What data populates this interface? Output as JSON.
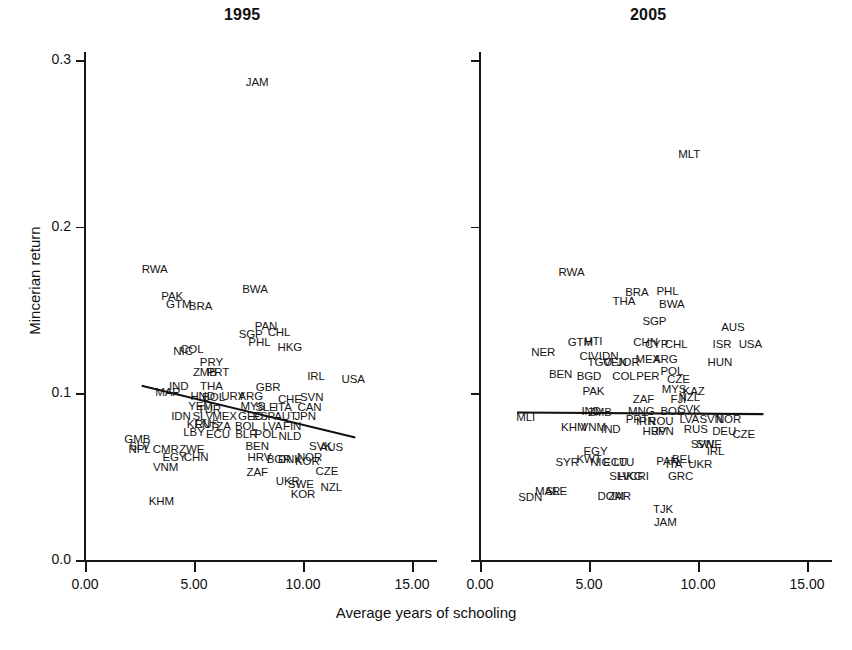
{
  "figure": {
    "xlabel": "Average years of schooling",
    "ylabel": "Mincerian return",
    "ink_color": "#111111"
  },
  "chart_data": {
    "type": "scatter",
    "title": "",
    "xlabel": "Average years of schooling",
    "ylabel": "Mincerian return",
    "xlim": [
      0.0,
      15.0
    ],
    "ylim": [
      0.0,
      0.3
    ],
    "xticks": [
      "0.00",
      "5.00",
      "10.00",
      "15.00"
    ],
    "yticks": [
      "0.0",
      "0.1",
      "0.2",
      "0.3"
    ],
    "grid": false,
    "legend": "none",
    "marker_style": "country-code-text-label",
    "panels": [
      {
        "name": "panel-1995",
        "title": "1995",
        "fit_line": {
          "x0": 2.6,
          "y0": 0.1045,
          "x1": 12.4,
          "y1": 0.0735
        },
        "points": [
          {
            "label": "JAM",
            "x": 7.9,
            "y": 0.286
          },
          {
            "label": "RWA",
            "x": 3.2,
            "y": 0.174
          },
          {
            "label": "PAK",
            "x": 4.0,
            "y": 0.158
          },
          {
            "label": "GTM",
            "x": 4.3,
            "y": 0.153
          },
          {
            "label": "BRA",
            "x": 5.3,
            "y": 0.152
          },
          {
            "label": "BWA",
            "x": 7.8,
            "y": 0.162
          },
          {
            "label": "PAN",
            "x": 8.3,
            "y": 0.14
          },
          {
            "label": "SGP",
            "x": 7.6,
            "y": 0.135
          },
          {
            "label": "CHL",
            "x": 8.9,
            "y": 0.136
          },
          {
            "label": "PHL",
            "x": 8.0,
            "y": 0.13
          },
          {
            "label": "HKG",
            "x": 9.4,
            "y": 0.127
          },
          {
            "label": "NIC",
            "x": 4.5,
            "y": 0.125
          },
          {
            "label": "COL",
            "x": 4.9,
            "y": 0.126
          },
          {
            "label": "PRY",
            "x": 5.8,
            "y": 0.118
          },
          {
            "label": "ZMB",
            "x": 5.5,
            "y": 0.112
          },
          {
            "label": "PRT",
            "x": 6.1,
            "y": 0.112
          },
          {
            "label": "IRL",
            "x": 10.6,
            "y": 0.11
          },
          {
            "label": "USA",
            "x": 12.3,
            "y": 0.108
          },
          {
            "label": "IND",
            "x": 4.3,
            "y": 0.104
          },
          {
            "label": "THA",
            "x": 5.8,
            "y": 0.104
          },
          {
            "label": "GBR",
            "x": 8.4,
            "y": 0.103
          },
          {
            "label": "MAR",
            "x": 3.8,
            "y": 0.1
          },
          {
            "label": "HND",
            "x": 5.4,
            "y": 0.098
          },
          {
            "label": "BOL",
            "x": 5.9,
            "y": 0.097
          },
          {
            "label": "URY",
            "x": 6.8,
            "y": 0.098
          },
          {
            "label": "ARG",
            "x": 7.6,
            "y": 0.098
          },
          {
            "label": "CHE",
            "x": 9.4,
            "y": 0.096
          },
          {
            "label": "SVN",
            "x": 10.4,
            "y": 0.097
          },
          {
            "label": "YEM",
            "x": 5.3,
            "y": 0.092
          },
          {
            "label": "TUR",
            "x": 5.7,
            "y": 0.09
          },
          {
            "label": "MYS",
            "x": 7.7,
            "y": 0.092
          },
          {
            "label": "SLE",
            "x": 8.3,
            "y": 0.091
          },
          {
            "label": "ITA",
            "x": 9.1,
            "y": 0.091
          },
          {
            "label": "CAN",
            "x": 10.3,
            "y": 0.091
          },
          {
            "label": "IDN",
            "x": 4.4,
            "y": 0.086
          },
          {
            "label": "SLV",
            "x": 5.4,
            "y": 0.086
          },
          {
            "label": "MEX",
            "x": 6.4,
            "y": 0.086
          },
          {
            "label": "GEO",
            "x": 7.6,
            "y": 0.086
          },
          {
            "label": "ESP",
            "x": 8.2,
            "y": 0.086
          },
          {
            "label": "AUT",
            "x": 9.2,
            "y": 0.086
          },
          {
            "label": "JPN",
            "x": 10.1,
            "y": 0.086
          },
          {
            "label": "KEN",
            "x": 5.2,
            "y": 0.081
          },
          {
            "label": "RUS",
            "x": 5.6,
            "y": 0.081
          },
          {
            "label": "TZA",
            "x": 6.2,
            "y": 0.08
          },
          {
            "label": "BOL",
            "x": 7.4,
            "y": 0.08
          },
          {
            "label": "LVA",
            "x": 8.6,
            "y": 0.08
          },
          {
            "label": "FIN",
            "x": 9.5,
            "y": 0.08
          },
          {
            "label": "LBY",
            "x": 5.0,
            "y": 0.076
          },
          {
            "label": "ECU",
            "x": 6.1,
            "y": 0.075
          },
          {
            "label": "BLR",
            "x": 7.4,
            "y": 0.075
          },
          {
            "label": "POL",
            "x": 8.3,
            "y": 0.075
          },
          {
            "label": "NLD",
            "x": 9.4,
            "y": 0.074
          },
          {
            "label": "GMB",
            "x": 2.4,
            "y": 0.072
          },
          {
            "label": "SLV",
            "x": 2.5,
            "y": 0.068
          },
          {
            "label": "NPL",
            "x": 2.5,
            "y": 0.066
          },
          {
            "label": "CMR",
            "x": 3.7,
            "y": 0.066
          },
          {
            "label": "ZWE",
            "x": 4.9,
            "y": 0.066
          },
          {
            "label": "BEN",
            "x": 7.9,
            "y": 0.068
          },
          {
            "label": "SVK",
            "x": 10.8,
            "y": 0.068
          },
          {
            "label": "AUS",
            "x": 11.3,
            "y": 0.067
          },
          {
            "label": "EGY",
            "x": 4.1,
            "y": 0.061
          },
          {
            "label": "CHN",
            "x": 5.1,
            "y": 0.061
          },
          {
            "label": "HRV",
            "x": 8.0,
            "y": 0.061
          },
          {
            "label": "BGR",
            "x": 8.9,
            "y": 0.06
          },
          {
            "label": "DNK",
            "x": 9.4,
            "y": 0.06
          },
          {
            "label": "KOR",
            "x": 10.2,
            "y": 0.059
          },
          {
            "label": "NOR",
            "x": 10.3,
            "y": 0.061
          },
          {
            "label": "VNM",
            "x": 3.7,
            "y": 0.055
          },
          {
            "label": "ZAF",
            "x": 7.9,
            "y": 0.052
          },
          {
            "label": "CZE",
            "x": 11.1,
            "y": 0.053
          },
          {
            "label": "UKR",
            "x": 9.3,
            "y": 0.047
          },
          {
            "label": "SWE",
            "x": 9.9,
            "y": 0.045
          },
          {
            "label": "NZL",
            "x": 11.3,
            "y": 0.043
          },
          {
            "label": "KOR",
            "x": 10.0,
            "y": 0.039
          },
          {
            "label": "KHM",
            "x": 3.5,
            "y": 0.035
          }
        ]
      },
      {
        "name": "panel-2005",
        "title": "2005",
        "fit_line": {
          "x0": 1.7,
          "y0": 0.0885,
          "x1": 13.0,
          "y1": 0.0875
        },
        "points": [
          {
            "label": "MLT",
            "x": 9.6,
            "y": 0.243
          },
          {
            "label": "RWA",
            "x": 4.2,
            "y": 0.172
          },
          {
            "label": "BRA",
            "x": 7.2,
            "y": 0.16
          },
          {
            "label": "PHL",
            "x": 8.6,
            "y": 0.161
          },
          {
            "label": "THA",
            "x": 6.6,
            "y": 0.155
          },
          {
            "label": "BWA",
            "x": 8.8,
            "y": 0.153
          },
          {
            "label": "SGP",
            "x": 8.0,
            "y": 0.143
          },
          {
            "label": "AUS",
            "x": 11.6,
            "y": 0.139
          },
          {
            "label": "GTM",
            "x": 4.6,
            "y": 0.13
          },
          {
            "label": "HTI",
            "x": 5.2,
            "y": 0.131
          },
          {
            "label": "CHN",
            "x": 7.6,
            "y": 0.13
          },
          {
            "label": "CYP",
            "x": 8.1,
            "y": 0.129
          },
          {
            "label": "CHL",
            "x": 9.0,
            "y": 0.129
          },
          {
            "label": "ISR",
            "x": 11.1,
            "y": 0.129
          },
          {
            "label": "USA",
            "x": 12.4,
            "y": 0.129
          },
          {
            "label": "NER",
            "x": 2.9,
            "y": 0.124
          },
          {
            "label": "CIV",
            "x": 5.0,
            "y": 0.122
          },
          {
            "label": "IDN",
            "x": 5.9,
            "y": 0.122
          },
          {
            "label": "TGO",
            "x": 5.5,
            "y": 0.118
          },
          {
            "label": "VEN",
            "x": 6.2,
            "y": 0.118
          },
          {
            "label": "JOR",
            "x": 6.8,
            "y": 0.118
          },
          {
            "label": "MEX",
            "x": 7.7,
            "y": 0.12
          },
          {
            "label": "ARG",
            "x": 8.5,
            "y": 0.12
          },
          {
            "label": "HUN",
            "x": 11.0,
            "y": 0.118
          },
          {
            "label": "BEN",
            "x": 3.7,
            "y": 0.111
          },
          {
            "label": "BGD",
            "x": 5.0,
            "y": 0.11
          },
          {
            "label": "COL",
            "x": 6.6,
            "y": 0.11
          },
          {
            "label": "PER",
            "x": 7.7,
            "y": 0.11
          },
          {
            "label": "POL",
            "x": 8.8,
            "y": 0.113
          },
          {
            "label": "CZE",
            "x": 9.1,
            "y": 0.108
          },
          {
            "label": "PAK",
            "x": 5.2,
            "y": 0.101
          },
          {
            "label": "MYS",
            "x": 8.9,
            "y": 0.102
          },
          {
            "label": "KAZ",
            "x": 9.8,
            "y": 0.101
          },
          {
            "label": "ZAF",
            "x": 7.5,
            "y": 0.096
          },
          {
            "label": "FJI",
            "x": 9.1,
            "y": 0.096
          },
          {
            "label": "NZL",
            "x": 9.6,
            "y": 0.097
          },
          {
            "label": "IND",
            "x": 5.1,
            "y": 0.089
          },
          {
            "label": "ZMB",
            "x": 5.5,
            "y": 0.088
          },
          {
            "label": "MNG",
            "x": 7.4,
            "y": 0.089
          },
          {
            "label": "BOL",
            "x": 8.8,
            "y": 0.089
          },
          {
            "label": "SVK",
            "x": 9.6,
            "y": 0.09
          },
          {
            "label": "MLI",
            "x": 2.1,
            "y": 0.085
          },
          {
            "label": "PRT",
            "x": 7.2,
            "y": 0.084
          },
          {
            "label": "IRN",
            "x": 7.6,
            "y": 0.083
          },
          {
            "label": "ROU",
            "x": 8.3,
            "y": 0.083
          },
          {
            "label": "LVA",
            "x": 9.6,
            "y": 0.084
          },
          {
            "label": "SVN",
            "x": 10.6,
            "y": 0.084
          },
          {
            "label": "NOR",
            "x": 11.4,
            "y": 0.084
          },
          {
            "label": "KHM",
            "x": 4.3,
            "y": 0.079
          },
          {
            "label": "VNM",
            "x": 5.2,
            "y": 0.079
          },
          {
            "label": "IND",
            "x": 6.0,
            "y": 0.078
          },
          {
            "label": "HRV",
            "x": 8.0,
            "y": 0.077
          },
          {
            "label": "JPN",
            "x": 8.4,
            "y": 0.077
          },
          {
            "label": "RUS",
            "x": 9.9,
            "y": 0.078
          },
          {
            "label": "DEU",
            "x": 11.2,
            "y": 0.077
          },
          {
            "label": "CZE",
            "x": 12.1,
            "y": 0.075
          },
          {
            "label": "SWE",
            "x": 10.5,
            "y": 0.069
          },
          {
            "label": "SVN",
            "x": 10.2,
            "y": 0.069
          },
          {
            "label": "EGY",
            "x": 5.3,
            "y": 0.065
          },
          {
            "label": "IRL",
            "x": 10.8,
            "y": 0.065
          },
          {
            "label": "KWT",
            "x": 5.0,
            "y": 0.06
          },
          {
            "label": "NIC",
            "x": 5.5,
            "y": 0.058
          },
          {
            "label": "ECU",
            "x": 6.2,
            "y": 0.058
          },
          {
            "label": "LTU",
            "x": 6.6,
            "y": 0.058
          },
          {
            "label": "PAN",
            "x": 8.6,
            "y": 0.059
          },
          {
            "label": "BEL",
            "x": 9.3,
            "y": 0.06
          },
          {
            "label": "ITA",
            "x": 8.9,
            "y": 0.057
          },
          {
            "label": "UKR",
            "x": 10.1,
            "y": 0.057
          },
          {
            "label": "SYR",
            "x": 4.0,
            "y": 0.058
          },
          {
            "label": "SLV",
            "x": 6.4,
            "y": 0.05
          },
          {
            "label": "HKG",
            "x": 6.9,
            "y": 0.05
          },
          {
            "label": "CRI",
            "x": 7.3,
            "y": 0.05
          },
          {
            "label": "GRC",
            "x": 9.2,
            "y": 0.05
          },
          {
            "label": "MAR",
            "x": 3.1,
            "y": 0.041
          },
          {
            "label": "SLE",
            "x": 3.5,
            "y": 0.041
          },
          {
            "label": "SDN",
            "x": 2.3,
            "y": 0.037
          },
          {
            "label": "DOM",
            "x": 6.0,
            "y": 0.038
          },
          {
            "label": "ZAR",
            "x": 6.4,
            "y": 0.038
          },
          {
            "label": "TJK",
            "x": 8.4,
            "y": 0.03
          },
          {
            "label": "JAM",
            "x": 8.5,
            "y": 0.022
          }
        ]
      }
    ]
  }
}
